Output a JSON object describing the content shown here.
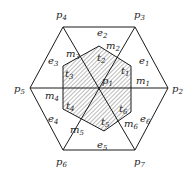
{
  "diagram": {
    "title": "",
    "outer_hexagon": {
      "vertices": {
        "p2": [
          168,
          88
        ],
        "p3": [
          135,
          27
        ],
        "p4": [
          63,
          27
        ],
        "p5": [
          30,
          88
        ],
        "p6": [
          63,
          150
        ],
        "p7": [
          135,
          150
        ]
      },
      "center": {
        "label": "p1",
        "point": [
          100,
          88
        ]
      }
    },
    "inner_hexagon": {
      "vertices": [
        [
          99,
          46
        ],
        [
          131,
          66
        ],
        [
          131,
          112
        ],
        [
          104,
          131
        ],
        [
          63,
          109
        ],
        [
          63,
          66
        ]
      ],
      "fill": "hatched"
    },
    "colors": {
      "line": "#1a1a1a",
      "hatch": "#444444",
      "background": "#ffffff"
    },
    "labels": {
      "points": [
        {
          "base": "p",
          "sub": "4",
          "x": 56,
          "y": 18
        },
        {
          "base": "p",
          "sub": "3",
          "x": 134,
          "y": 18
        },
        {
          "base": "p",
          "sub": "5",
          "x": 14,
          "y": 92
        },
        {
          "base": "p",
          "sub": "2",
          "x": 172,
          "y": 92
        },
        {
          "base": "p",
          "sub": "6",
          "x": 56,
          "y": 165
        },
        {
          "base": "p",
          "sub": "7",
          "x": 134,
          "y": 165
        },
        {
          "base": "p",
          "sub": "1",
          "x": 102,
          "y": 84
        }
      ],
      "edges": [
        {
          "base": "e",
          "sub": "2",
          "x": 97,
          "y": 36
        },
        {
          "base": "e",
          "sub": "1",
          "x": 139,
          "y": 64
        },
        {
          "base": "e",
          "sub": "3",
          "x": 48,
          "y": 64
        },
        {
          "base": "e",
          "sub": "4",
          "x": 48,
          "y": 122
        },
        {
          "base": "e",
          "sub": "6",
          "x": 140,
          "y": 122
        },
        {
          "base": "e",
          "sub": "5",
          "x": 97,
          "y": 148
        }
      ],
      "midpoints": [
        {
          "base": "m",
          "sub": "2",
          "x": 106,
          "y": 49
        },
        {
          "base": "m",
          "sub": "3",
          "x": 66,
          "y": 57
        },
        {
          "base": "m",
          "sub": "1",
          "x": 136,
          "y": 84
        },
        {
          "base": "m",
          "sub": "4",
          "x": 45,
          "y": 99
        },
        {
          "base": "m",
          "sub": "5",
          "x": 70,
          "y": 133
        },
        {
          "base": "m",
          "sub": "6",
          "x": 124,
          "y": 127
        }
      ],
      "triangles": [
        {
          "base": "t",
          "sub": "2",
          "x": 97,
          "y": 61
        },
        {
          "base": "t",
          "sub": "3",
          "x": 65,
          "y": 77
        },
        {
          "base": "t",
          "sub": "1",
          "x": 121,
          "y": 74
        },
        {
          "base": "t",
          "sub": "4",
          "x": 66,
          "y": 109
        },
        {
          "base": "t",
          "sub": "6",
          "x": 119,
          "y": 112
        },
        {
          "base": "t",
          "sub": "5",
          "x": 101,
          "y": 125
        }
      ]
    }
  }
}
